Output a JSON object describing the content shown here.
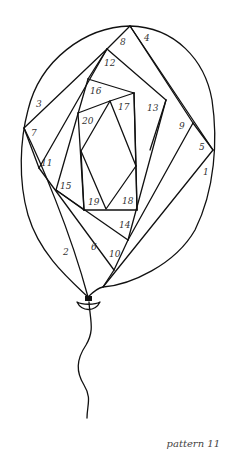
{
  "title": "pattern 11",
  "colors": {
    "stroke": "#111111",
    "label": "#333333",
    "background": "#ffffff"
  },
  "labels": [
    {
      "text": "1",
      "x": 203,
      "y": 175
    },
    {
      "text": "2",
      "x": 63,
      "y": 255
    },
    {
      "text": "3",
      "x": 36,
      "y": 107
    },
    {
      "text": "4",
      "x": 144,
      "y": 41
    },
    {
      "text": "5",
      "x": 199,
      "y": 150
    },
    {
      "text": "6",
      "x": 91,
      "y": 250
    },
    {
      "text": "7",
      "x": 31,
      "y": 136
    },
    {
      "text": "8",
      "x": 120,
      "y": 45
    },
    {
      "text": "9",
      "x": 179,
      "y": 129
    },
    {
      "text": "10",
      "x": 109,
      "y": 257
    },
    {
      "text": "11",
      "x": 41,
      "y": 166
    },
    {
      "text": "12",
      "x": 104,
      "y": 66
    },
    {
      "text": "13",
      "x": 147,
      "y": 111
    },
    {
      "text": "14",
      "x": 119,
      "y": 228
    },
    {
      "text": "15",
      "x": 60,
      "y": 189
    },
    {
      "text": "16",
      "x": 90,
      "y": 94
    },
    {
      "text": "17",
      "x": 118,
      "y": 110
    },
    {
      "text": "18",
      "x": 122,
      "y": 204
    },
    {
      "text": "19",
      "x": 88,
      "y": 205
    },
    {
      "text": "20",
      "x": 82,
      "y": 124
    }
  ]
}
